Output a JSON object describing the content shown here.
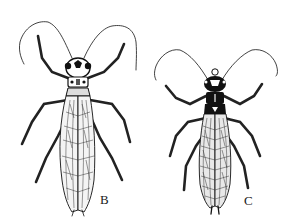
{
  "figure": {
    "specimens": [
      {
        "id": "B",
        "label": "B",
        "description": "stonefly adult, dorsal view, light-bodied with patterned head"
      },
      {
        "id": "C",
        "label": "C",
        "description": "stonefly adult, dorsal view, dark-bodied with dark head"
      }
    ]
  }
}
